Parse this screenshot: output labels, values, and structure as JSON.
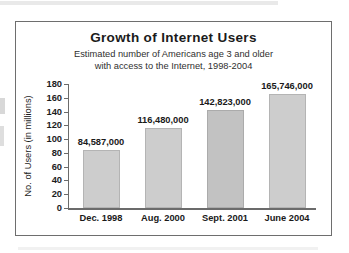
{
  "chart_data": {
    "type": "bar",
    "title": "Growth of Internet Users",
    "subtitle_line1": "Estimated number of Americans age 3 and older",
    "subtitle_line2": "with access to the Internet, 1998-2004",
    "xlabel": "",
    "ylabel": "No. of Users (in millions)",
    "ylim": [
      0,
      180
    ],
    "ytick_step": 20,
    "ytick_labels": [
      "180",
      "160",
      "140",
      "120",
      "100",
      "80",
      "60",
      "40",
      "20",
      "0"
    ],
    "ytick_values": [
      180,
      160,
      140,
      120,
      100,
      80,
      60,
      40,
      20,
      0
    ],
    "grid": false,
    "legend": false,
    "categories": [
      "Dec. 1998",
      "Aug. 2000",
      "Sept. 2001",
      "June 2004"
    ],
    "values": [
      84.587,
      116.48,
      142.823,
      165.746
    ],
    "data_labels": [
      "84,587,000",
      "116,480,000",
      "142,823,000",
      "165,746,000"
    ],
    "bar_color": "#cdcdcd",
    "bar_border_color": "#b4b4b4",
    "axis_color": "#6b6b6b",
    "text_color": "#1a1a1a"
  }
}
